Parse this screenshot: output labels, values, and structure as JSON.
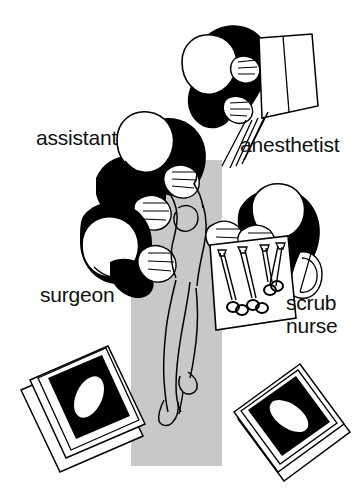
{
  "figure": {
    "background_color": "#ffffff",
    "ink_color": "#000000",
    "table_color": "#c8c8c8",
    "width": 363,
    "height": 500
  },
  "labels": {
    "assistant": "assistant",
    "anesthetist": "anesthetist",
    "surgeon": "surgeon",
    "scrub_nurse_line1": "scrub",
    "scrub_nurse_line2": "nurse"
  },
  "roles": [
    {
      "name": "assistant",
      "label": "assistant",
      "position": "upper-left, standing at patient's torso",
      "gown_color": "#000000",
      "head_color": "#ffffff"
    },
    {
      "name": "anesthetist",
      "label": "anesthetist",
      "position": "top, at patient's head beside anesthesia machine",
      "gown_color": "#000000",
      "head_color": "#ffffff"
    },
    {
      "name": "surgeon",
      "label": "surgeon",
      "position": "lower-left, at operative site",
      "gown_color": "#000000",
      "head_color": "#ffffff"
    },
    {
      "name": "scrub-nurse",
      "label": "scrub nurse",
      "position": "right, behind instrument tray",
      "gown_color": "#000000",
      "head_color": "#ffffff"
    }
  ],
  "equipment": [
    {
      "name": "operating-table",
      "description": "vertical grey rectangular operating table",
      "color": "#c8c8c8"
    },
    {
      "name": "patient",
      "description": "supine patient outlined on table, legs toward viewer",
      "color": "#c8c8c8"
    },
    {
      "name": "anesthesia-machine-panel",
      "description": "tilted rectangular panel with vertical divider held by anesthetist"
    },
    {
      "name": "instrument-tray",
      "description": "tilted rectangular tray holding ringed surgical instruments",
      "instrument_count": 4
    },
    {
      "name": "monitor-left",
      "description": "tilted monitor unit, black screen with white oval highlight"
    },
    {
      "name": "monitor-right",
      "description": "tilted monitor unit, black screen with white oval highlight"
    }
  ]
}
